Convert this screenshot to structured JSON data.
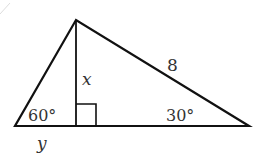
{
  "diagram": {
    "type": "right-triangle-with-altitude",
    "vertices": {
      "apex": [
        76,
        20
      ],
      "left": [
        15,
        126
      ],
      "right": [
        249,
        126
      ],
      "foot": [
        76,
        126
      ]
    },
    "labels": {
      "hypotenuse_length": "8",
      "altitude": "x",
      "left_angle": "60°",
      "right_angle": "30°",
      "left_segment": "y"
    },
    "colors": {
      "stroke": "#111111",
      "text": "#333333",
      "background": "#ffffff"
    }
  }
}
